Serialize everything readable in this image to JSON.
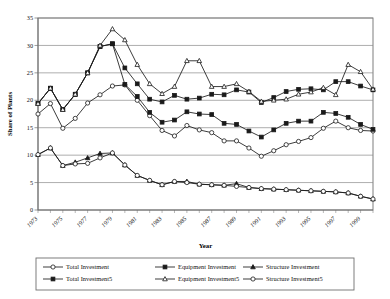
{
  "chart_data": {
    "type": "line",
    "title": "",
    "xlabel": "Year",
    "ylabel": "Share of Plants",
    "ylim": [
      0,
      35
    ],
    "ytick_step": 5,
    "yticks": [
      0,
      5,
      10,
      15,
      20,
      25,
      30,
      35
    ],
    "grid": true,
    "grid_axis": "y",
    "legend_position": "bottom",
    "x": [
      1973,
      1974,
      1975,
      1976,
      1977,
      1978,
      1979,
      1980,
      1981,
      1982,
      1983,
      1984,
      1985,
      1986,
      1987,
      1988,
      1989,
      1990,
      1991,
      1992,
      1993,
      1994,
      1995,
      1996,
      1997,
      1998,
      1999,
      2000
    ],
    "xtick_labels": [
      "1973",
      "1975",
      "1977",
      "1979",
      "1981",
      "1983",
      "1985",
      "1987",
      "1989",
      "1991",
      "1993",
      "1995",
      "1997",
      "1999"
    ],
    "series": [
      {
        "name": "Total Investment",
        "marker": "open-circle",
        "values": [
          17.5,
          19.4,
          14.9,
          16.7,
          19.5,
          21.0,
          22.6,
          22.8,
          20.0,
          17.2,
          14.5,
          13.5,
          15.4,
          14.6,
          14.1,
          12.6,
          12.6,
          11.3,
          9.8,
          10.8,
          11.9,
          12.5,
          13.2,
          14.9,
          16.2,
          15.0,
          14.5,
          14.4
        ]
      },
      {
        "name": "Total Investment5",
        "marker": "filled-square",
        "values": [
          19.4,
          22.2,
          18.3,
          21.1,
          25.0,
          29.8,
          30.3,
          22.9,
          20.7,
          17.8,
          16.0,
          16.4,
          17.9,
          17.5,
          17.4,
          15.8,
          15.6,
          14.4,
          13.3,
          14.6,
          15.8,
          16.2,
          16.2,
          17.8,
          17.6,
          16.9,
          15.6,
          14.7
        ]
      },
      {
        "name": "Equipment Investment",
        "marker": "filled-square",
        "values": [
          19.4,
          22.2,
          18.3,
          21.1,
          25.0,
          29.8,
          30.3,
          25.9,
          23.0,
          20.2,
          19.7,
          20.9,
          20.2,
          20.4,
          21.1,
          21.0,
          21.9,
          21.5,
          19.6,
          20.5,
          21.6,
          22.0,
          22.1,
          21.9,
          23.4,
          23.4,
          22.6,
          21.9
        ]
      },
      {
        "name": "Equipment Investment5",
        "marker": "open-triangle",
        "values": [
          19.4,
          22.2,
          18.3,
          21.1,
          25.0,
          30.0,
          33.0,
          31.0,
          26.5,
          23.0,
          21.2,
          22.5,
          27.2,
          27.2,
          22.5,
          22.5,
          23.0,
          21.6,
          19.8,
          20.0,
          20.2,
          21.1,
          21.5,
          22.3,
          21.0,
          26.5,
          25.2,
          22.0
        ]
      },
      {
        "name": "Structure Investment",
        "marker": "filled-triangle",
        "values": [
          10.1,
          11.3,
          8.1,
          8.7,
          9.5,
          10.3,
          10.4,
          8.2,
          6.3,
          5.4,
          4.6,
          5.2,
          5.2,
          4.7,
          4.6,
          4.5,
          4.8,
          4.1,
          3.9,
          3.8,
          3.7,
          3.6,
          3.5,
          3.4,
          3.3,
          3.1,
          2.5,
          2.0
        ]
      },
      {
        "name": "Structure Investment5",
        "marker": "open-circle",
        "values": [
          10.1,
          11.3,
          8.1,
          8.4,
          8.5,
          9.5,
          10.4,
          8.2,
          6.3,
          5.4,
          4.6,
          5.2,
          5.0,
          4.7,
          4.6,
          4.5,
          4.3,
          4.1,
          3.9,
          3.8,
          3.7,
          3.6,
          3.5,
          3.4,
          3.3,
          3.1,
          2.5,
          2.0
        ]
      }
    ]
  },
  "legend": {
    "entries": [
      {
        "label": "Total Investment",
        "marker": "open-circle"
      },
      {
        "label": "Equipment Investment",
        "marker": "filled-square"
      },
      {
        "label": "Structure Investment",
        "marker": "filled-triangle"
      },
      {
        "label": "Total Investment5",
        "marker": "filled-square"
      },
      {
        "label": "Equipment Investment5",
        "marker": "open-triangle"
      },
      {
        "label": "Structure Investment5",
        "marker": "open-circle"
      }
    ]
  }
}
